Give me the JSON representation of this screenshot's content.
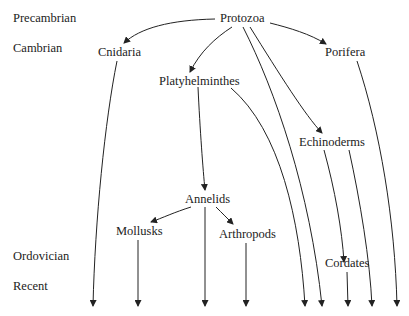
{
  "periods": {
    "precambrian": "Precambrian",
    "cambrian": "Cambrian",
    "ordovician": "Ordovician",
    "recent": "Recent"
  },
  "taxa": {
    "protozoa": "Protozoa",
    "cnidaria": "Cnidaria",
    "porifera": "Porifera",
    "platyhelminthes": "Platyhelminthes",
    "echinoderms": "Echinoderms",
    "annelids": "Annelids",
    "mollusks": "Mollusks",
    "arthropods": "Arthropods",
    "cordates": "Cordates"
  },
  "colors": {
    "line": "#222222",
    "text": "#222222"
  }
}
